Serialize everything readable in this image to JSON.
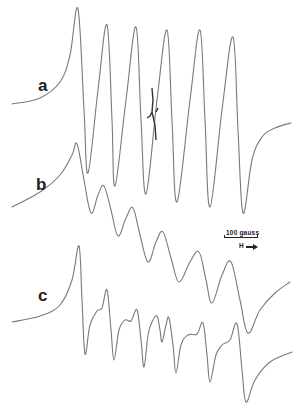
{
  "figure": {
    "labels": {
      "a": "a",
      "b": "b",
      "c": "c"
    },
    "scale": {
      "text": "100 gauss",
      "field_label": "H"
    },
    "colors": {
      "trace": "#7a7a7a",
      "text": "#222222",
      "background": "#ffffff"
    }
  },
  "chart_data": {
    "type": "line",
    "title": "",
    "xlabel": "H (magnetic field) →",
    "ylabel": "",
    "grid": false,
    "legend": "none; traces labelled a, b, c at left",
    "annotations": [
      "100 gauss scale bar",
      "H → field direction arrow"
    ],
    "series": [
      {
        "name": "a",
        "description": "six-line derivative spectrum with small sharp artifact near center",
        "points_px": [
          [
            12,
            104
          ],
          [
            40,
            98
          ],
          [
            60,
            82
          ],
          [
            70,
            55
          ],
          [
            78,
            9
          ],
          [
            84,
            110
          ],
          [
            88,
            173
          ],
          [
            98,
            90
          ],
          [
            107,
            25
          ],
          [
            112,
            120
          ],
          [
            115,
            186
          ],
          [
            126,
            100
          ],
          [
            136,
            27
          ],
          [
            141,
            120
          ],
          [
            146,
            194
          ],
          [
            157,
            100
          ],
          [
            167,
            30
          ],
          [
            172,
            120
          ],
          [
            177,
            202
          ],
          [
            190,
            100
          ],
          [
            200,
            30
          ],
          [
            205,
            120
          ],
          [
            210,
            207
          ],
          [
            222,
            110
          ],
          [
            233,
            37
          ],
          [
            238,
            130
          ],
          [
            243,
            213
          ],
          [
            252,
            160
          ],
          [
            262,
            137
          ],
          [
            275,
            128
          ],
          [
            291,
            123
          ]
        ]
      },
      {
        "name": "b",
        "description": "broad six-line derivative spectrum, shifted downward",
        "points_px": [
          [
            12,
            207
          ],
          [
            40,
            192
          ],
          [
            60,
            175
          ],
          [
            72,
            155
          ],
          [
            77,
            144
          ],
          [
            84,
            180
          ],
          [
            91,
            213
          ],
          [
            98,
            195
          ],
          [
            104,
            186
          ],
          [
            111,
            210
          ],
          [
            118,
            236
          ],
          [
            126,
            218
          ],
          [
            133,
            208
          ],
          [
            140,
            235
          ],
          [
            148,
            262
          ],
          [
            156,
            242
          ],
          [
            163,
            232
          ],
          [
            171,
            258
          ],
          [
            179,
            282
          ],
          [
            190,
            262
          ],
          [
            199,
            252
          ],
          [
            206,
            280
          ],
          [
            212,
            303
          ],
          [
            222,
            275
          ],
          [
            231,
            262
          ],
          [
            240,
            300
          ],
          [
            248,
            333
          ],
          [
            260,
            310
          ],
          [
            275,
            293
          ],
          [
            290,
            282
          ]
        ]
      },
      {
        "name": "c",
        "description": "resolved hyperfine spectrum with additional splitting",
        "points_px": [
          [
            12,
            322
          ],
          [
            40,
            316
          ],
          [
            60,
            305
          ],
          [
            72,
            280
          ],
          [
            79,
            246
          ],
          [
            82,
            300
          ],
          [
            85,
            354
          ],
          [
            90,
            325
          ],
          [
            97,
            311
          ],
          [
            102,
            308
          ],
          [
            107,
            290
          ],
          [
            111,
            330
          ],
          [
            114,
            360
          ],
          [
            119,
            330
          ],
          [
            125,
            320
          ],
          [
            131,
            321
          ],
          [
            137,
            310
          ],
          [
            141,
            340
          ],
          [
            144,
            367
          ],
          [
            148,
            335
          ],
          [
            152,
            322
          ],
          [
            157,
            316
          ],
          [
            160,
            330
          ],
          [
            162,
            342
          ],
          [
            166,
            325
          ],
          [
            169,
            318
          ],
          [
            173,
            345
          ],
          [
            176,
            373
          ],
          [
            181,
            345
          ],
          [
            188,
            335
          ],
          [
            197,
            334
          ],
          [
            203,
            323
          ],
          [
            207,
            355
          ],
          [
            210,
            382
          ],
          [
            216,
            355
          ],
          [
            222,
            345
          ],
          [
            230,
            340
          ],
          [
            237,
            324
          ],
          [
            242,
            370
          ],
          [
            246,
            402
          ],
          [
            255,
            380
          ],
          [
            270,
            362
          ],
          [
            292,
            352
          ]
        ]
      }
    ],
    "scale_bar": {
      "label": "100 gauss",
      "length_px": 33
    }
  }
}
